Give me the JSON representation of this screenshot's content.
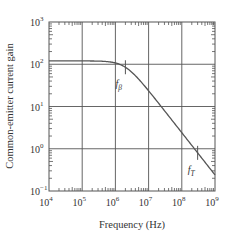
{
  "chart_data": {
    "type": "line",
    "title": "",
    "xlabel": "Frequency (Hz)",
    "ylabel": "Common-emitter current gain",
    "xscale": "log",
    "yscale": "log",
    "xlim": [
      10000,
      1000000000
    ],
    "ylim": [
      0.1,
      1000
    ],
    "x_ticks": [
      {
        "exp": "4",
        "label": "10^4"
      },
      {
        "exp": "5",
        "label": "10^5"
      },
      {
        "exp": "6",
        "label": "10^6"
      },
      {
        "exp": "7",
        "label": "10^7"
      },
      {
        "exp": "8",
        "label": "10^8"
      },
      {
        "exp": "9",
        "label": "10^9"
      }
    ],
    "y_ticks": [
      {
        "exp": "3",
        "label": "10^3"
      },
      {
        "exp": "2",
        "label": "10^2"
      },
      {
        "exp": "1",
        "label": "10^1"
      },
      {
        "exp": "0",
        "label": "10^0"
      },
      {
        "exp": "−1",
        "label": "10^-1"
      }
    ],
    "grid": true,
    "legend": null,
    "series": [
      {
        "name": "beta(f)",
        "x": [
          10000,
          100000,
          500000,
          1000000,
          2000000,
          5000000,
          10000000,
          30000000,
          100000000,
          300000000,
          1000000000
        ],
        "values": [
          120,
          120,
          118,
          112,
          95,
          58,
          32,
          11,
          3.3,
          1.1,
          0.35
        ]
      }
    ],
    "annotations": [
      {
        "text": "f_β",
        "base": "f",
        "sub": "β",
        "x": 2000000,
        "y": 100,
        "note": "beta cutoff frequency"
      },
      {
        "text": "f_T",
        "base": "f",
        "sub": "T",
        "x": 300000000,
        "y": 1,
        "note": "unity-gain (transition) frequency"
      }
    ],
    "colors": {
      "line": "#555555",
      "grid": "#555555",
      "text": "#333333"
    }
  }
}
